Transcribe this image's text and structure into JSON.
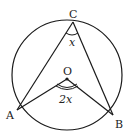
{
  "diagram": {
    "type": "circle-inscribed-angle",
    "points": {
      "C": {
        "label": "C",
        "x": 73,
        "y": 22
      },
      "O": {
        "label": "O",
        "x": 67,
        "y": 79
      },
      "A": {
        "label": "A",
        "x": 17,
        "y": 110
      },
      "B": {
        "label": "B",
        "x": 113,
        "y": 115
      }
    },
    "angle_labels": {
      "at_C": "x",
      "at_O": "2x"
    },
    "circle": {
      "cx": 67,
      "cy": 75,
      "r": 55
    },
    "stroke_color": "#1a1a1a"
  }
}
